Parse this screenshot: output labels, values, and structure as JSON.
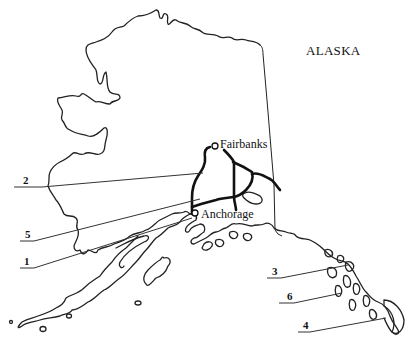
{
  "map": {
    "title": "ALASKA",
    "cities": [
      {
        "name": "Fairbanks"
      },
      {
        "name": "Anchorage"
      }
    ],
    "callouts": [
      {
        "label": "2"
      },
      {
        "label": "5"
      },
      {
        "label": "1"
      },
      {
        "label": "3"
      },
      {
        "label": "6"
      },
      {
        "label": "4"
      }
    ],
    "colors": {
      "background": "#ffffff",
      "ink": "#111111"
    }
  }
}
